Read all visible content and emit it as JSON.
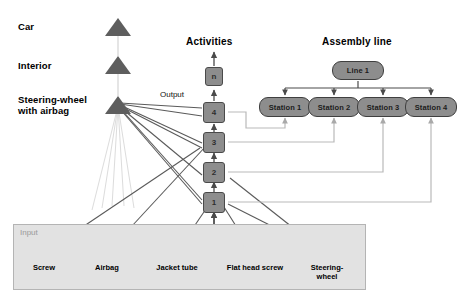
{
  "diagram": {
    "title_activities": "Activities",
    "title_assembly": "Assembly line",
    "label_output": "Output",
    "label_input": "Input",
    "hierarchy": [
      {
        "label": "Car",
        "icon": "triangle-icon"
      },
      {
        "label": "Interior",
        "icon": "triangle-icon"
      },
      {
        "label": "Steering-wheel\nwith airbag",
        "icon": "triangle-icon"
      }
    ],
    "activities": [
      {
        "label": "n"
      },
      {
        "label": "4"
      },
      {
        "label": "3"
      },
      {
        "label": "2"
      },
      {
        "label": "1"
      }
    ],
    "assembly_line": {
      "line_label": "Line 1",
      "stations": [
        {
          "label": "Station 1"
        },
        {
          "label": "Station 2"
        },
        {
          "label": "Station 3"
        },
        {
          "label": "Station 4"
        }
      ]
    },
    "inputs": [
      {
        "label": "Screw",
        "circles": 1
      },
      {
        "label": "Airbag",
        "circles": 4
      },
      {
        "label": "Jacket tube",
        "circles": 4
      },
      {
        "label": "Flat head screw",
        "circles": 1
      },
      {
        "label": "Steering-\nwheel",
        "circles": 4
      }
    ],
    "colors": {
      "node_fill": "#8d8d8d",
      "node_stroke": "#4a4a4a",
      "panel_fill": "#e2e2e2",
      "panel_stroke": "#b4b4b4",
      "connector_dark": "#5a5a5a",
      "connector_light": "#b9b9b9",
      "triangle_fill": "#5e5e5e"
    }
  }
}
